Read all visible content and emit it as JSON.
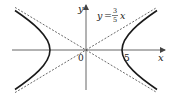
{
  "diagram": {
    "type": "hyperbola",
    "equation_hint": "x^2/25 - y^2/9 = 1",
    "x_axis_label": "x",
    "y_axis_label": "y",
    "origin_label": "0",
    "vertex_label": "5",
    "asymptote_label": {
      "lhs": "y",
      "eq": "=",
      "numerator": "3",
      "denominator": "5",
      "var": "x"
    },
    "colors": {
      "curve": "#1a1a1a",
      "axis": "#555555",
      "asymptote": "#444444"
    }
  }
}
